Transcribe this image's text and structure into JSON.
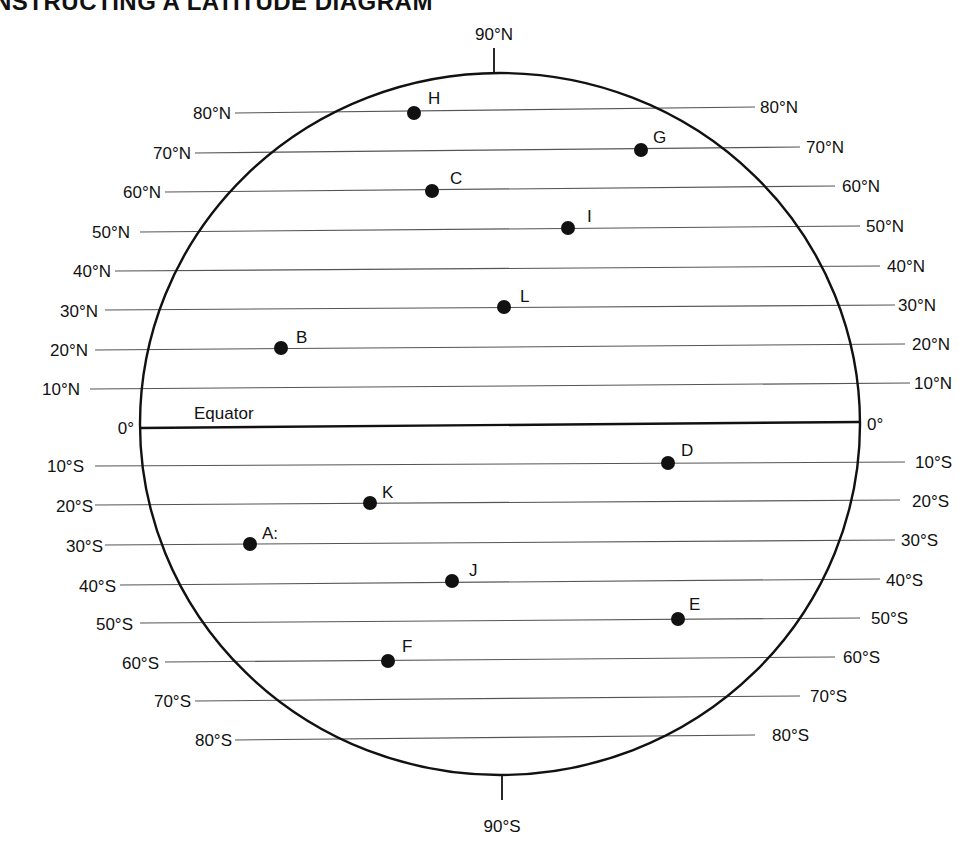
{
  "title": "NSTRUCTING A LATITUDE DIAGRAM",
  "poles": {
    "north": "90°N",
    "south": "90°S"
  },
  "equator_label": "Equator",
  "latitudes": [
    {
      "deg": 80,
      "label_left": "80°N",
      "label_right": "80°N"
    },
    {
      "deg": 70,
      "label_left": "70°N",
      "label_right": "70°N"
    },
    {
      "deg": 60,
      "label_left": "60°N",
      "label_right": "60°N"
    },
    {
      "deg": 50,
      "label_left": "50°N",
      "label_right": "50°N"
    },
    {
      "deg": 40,
      "label_left": "40°N",
      "label_right": "40°N"
    },
    {
      "deg": 30,
      "label_left": "30°N",
      "label_right": "30°N"
    },
    {
      "deg": 20,
      "label_left": "20°N",
      "label_right": "20°N"
    },
    {
      "deg": 10,
      "label_left": "10°N",
      "label_right": "10°N"
    },
    {
      "deg": 0,
      "label_left": "0°",
      "label_right": "0°"
    },
    {
      "deg": -10,
      "label_left": "10°S",
      "label_right": "10°S"
    },
    {
      "deg": -20,
      "label_left": "20°S",
      "label_right": "20°S"
    },
    {
      "deg": -30,
      "label_left": "30°S",
      "label_right": "30°S"
    },
    {
      "deg": -40,
      "label_left": "40°S",
      "label_right": "40°S"
    },
    {
      "deg": -50,
      "label_left": "50°S",
      "label_right": "50°S"
    },
    {
      "deg": -60,
      "label_left": "60°S",
      "label_right": "60°S"
    },
    {
      "deg": -70,
      "label_left": "70°S",
      "label_right": "70°S"
    },
    {
      "deg": -80,
      "label_left": "80°S",
      "label_right": "80°S"
    }
  ],
  "points": [
    {
      "label": "H",
      "lat": "80°N"
    },
    {
      "label": "G",
      "lat": "70°N"
    },
    {
      "label": "C",
      "lat": "60°N"
    },
    {
      "label": "I",
      "lat": "50°N"
    },
    {
      "label": "L",
      "lat": "30°N"
    },
    {
      "label": "B",
      "lat": "20°N"
    },
    {
      "label": "D",
      "lat": "10°S"
    },
    {
      "label": "K",
      "lat": "20°S"
    },
    {
      "label": "A:",
      "lat": "30°S"
    },
    {
      "label": "J",
      "lat": "40°S"
    },
    {
      "label": "E",
      "lat": "50°S"
    },
    {
      "label": "F",
      "lat": "60°S"
    }
  ],
  "colors": {
    "ink": "#111111",
    "line": "#555555",
    "background": "#ffffff"
  }
}
